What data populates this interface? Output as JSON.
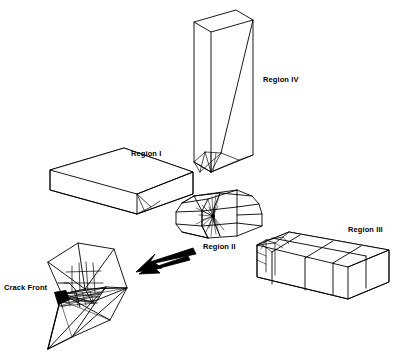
{
  "figure": {
    "kind": "engineering-diagram",
    "background_color": "#ffffff",
    "line_color": "#000000"
  },
  "labels": {
    "region_one": "Region I",
    "region_two": "Region II",
    "region_three": "Region III",
    "region_four": "Region IV",
    "crack_front": "Crack Front"
  },
  "label_positions": {
    "region_one": {
      "x": 131,
      "y": 150
    },
    "region_two": {
      "x": 203,
      "y": 243
    },
    "region_three": {
      "x": 348,
      "y": 226
    },
    "region_four": {
      "x": 263,
      "y": 76
    },
    "crack_front": {
      "x": 4,
      "y": 284
    }
  },
  "annotations": {
    "arrow": {
      "name": "assembly-arrow",
      "direction": "left",
      "from": {
        "x": 193,
        "y": 248
      },
      "to": {
        "x": 136,
        "y": 272
      }
    },
    "crack_front_leader": {
      "name": "crack-front-leader-line",
      "points": "58,283 69,283 75,289 78,300 80,308"
    }
  }
}
